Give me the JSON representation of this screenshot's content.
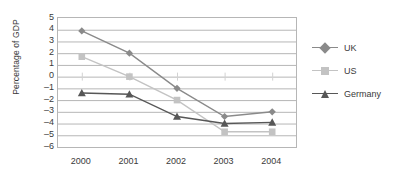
{
  "chart_data": {
    "type": "line",
    "title": "",
    "xlabel": "",
    "ylabel": "Percentage of GDP",
    "categories": [
      "2000",
      "2001",
      "2002",
      "2003",
      "2004"
    ],
    "yticks": [
      "5",
      "4",
      "3",
      "2",
      "1",
      "0",
      "–1",
      "–2",
      "–3",
      "–4",
      "–5",
      "–6"
    ],
    "ylim": [
      -6,
      5
    ],
    "grid": true,
    "legend_position": "right",
    "series": [
      {
        "name": "UK",
        "color": "#8a8a8a",
        "marker": "diamond",
        "values": [
          3.9,
          2.0,
          -1.0,
          -3.4,
          -3.0
        ]
      },
      {
        "name": "US",
        "color": "#c3c3c3",
        "marker": "square",
        "values": [
          1.7,
          0.0,
          -2.0,
          -4.7,
          -4.7
        ]
      },
      {
        "name": "Germany",
        "color": "#575757",
        "marker": "triangle",
        "values": [
          -1.4,
          -1.5,
          -3.4,
          -4.0,
          -3.9
        ]
      }
    ]
  },
  "colors": {
    "axis": "#b6b6b6",
    "grid": "#b6b6b6",
    "text": "#3a3a3a",
    "background": "#ffffff"
  }
}
